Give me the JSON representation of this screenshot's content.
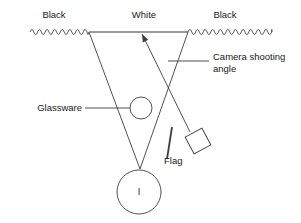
{
  "diagram": {
    "background_color": "#ffffff",
    "line_color": "#3c3c44",
    "white_backdrop_color": "#9a9a9a",
    "labels": {
      "black_left": "Black",
      "white_center": "White",
      "black_right": "Black",
      "camera_angle_line1": "Camera shooting",
      "camera_angle_line2": "angle",
      "glassware": "Glassware",
      "flag": "Flag",
      "bottle_mark": "l"
    }
  },
  "geometry": {
    "backdrop_y": 32,
    "left_junction_x": 89,
    "right_junction_x": 188,
    "wave_left_start_x": 30,
    "wave_right_end_x": 272,
    "wave_amplitude": 2.6,
    "wave_period": 7.6,
    "v_apex": {
      "x": 140,
      "y": 169
    },
    "glassware_circle": {
      "cx": 141,
      "cy": 108,
      "r": 11
    },
    "bottle_circle": {
      "cx": 139,
      "cy": 192,
      "r": 22
    },
    "camera_square": {
      "cx": 198,
      "cy": 141,
      "size": 19,
      "rotation_deg": -28
    },
    "camera_ray_start": {
      "x": 142,
      "y": 34
    },
    "camera_ray_end": {
      "x": 190,
      "y": 132
    },
    "flag_top": {
      "x": 172,
      "y": 127
    },
    "flag_bottom": {
      "x": 167,
      "y": 159
    },
    "glassware_leader": {
      "x1": 85,
      "y1": 108,
      "x2": 130,
      "y2": 108
    },
    "camera_leader": {
      "x1": 168,
      "y1": 61,
      "x2": 209,
      "y2": 61
    }
  },
  "label_positions": {
    "black_left": {
      "x": 54,
      "y": 15
    },
    "white_center": {
      "x": 144,
      "y": 15
    },
    "black_right": {
      "x": 225,
      "y": 15
    },
    "camera_angle": {
      "x": 213,
      "y": 57
    },
    "glassware": {
      "x": 82,
      "y": 108
    },
    "flag": {
      "x": 164,
      "y": 161
    },
    "bottle_mark": {
      "x": 139,
      "y": 192
    }
  }
}
